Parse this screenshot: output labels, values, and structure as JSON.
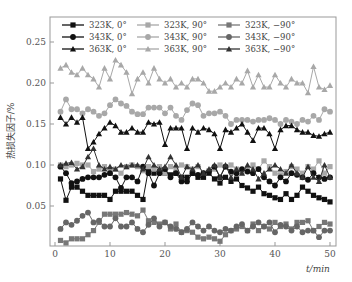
{
  "chart_data": {
    "type": "line",
    "title": "",
    "xlabel": "t/min",
    "ylabel": "热损失因子/%",
    "xlim": [
      -1,
      51
    ],
    "ylim": [
      0,
      0.275
    ],
    "xticks": [
      0,
      10,
      20,
      30,
      40,
      50
    ],
    "xtick_labels": [
      "0",
      "10",
      "20",
      "30",
      "40",
      "50"
    ],
    "yticks": [
      0.05,
      0.1,
      0.15,
      0.2,
      0.25
    ],
    "ytick_labels": [
      "0.05",
      "0.10",
      "0.15",
      "0.20",
      "0.25"
    ],
    "grid": false,
    "legend_position": "top, 3 columns inside plot",
    "x": [
      1,
      2,
      3,
      4,
      5,
      6,
      7,
      8,
      9,
      10,
      11,
      12,
      13,
      14,
      15,
      16,
      17,
      18,
      19,
      20,
      21,
      22,
      23,
      24,
      25,
      26,
      27,
      28,
      29,
      30,
      31,
      32,
      33,
      34,
      35,
      36,
      37,
      38,
      39,
      40,
      41,
      42,
      43,
      44,
      45,
      46,
      47,
      48,
      49,
      50
    ],
    "series": [
      {
        "name": "323K, 0°",
        "color": "#111111",
        "marker": "square",
        "values": [
          0.083,
          0.057,
          0.073,
          0.073,
          0.068,
          0.063,
          0.063,
          0.063,
          0.063,
          0.058,
          0.068,
          0.068,
          0.068,
          0.068,
          0.063,
          0.058,
          0.095,
          0.09,
          0.095,
          0.09,
          0.088,
          0.09,
          0.085,
          0.085,
          0.09,
          0.085,
          0.085,
          0.09,
          0.083,
          0.078,
          0.085,
          0.08,
          0.083,
          0.075,
          0.072,
          0.068,
          0.073,
          0.065,
          0.063,
          0.06,
          0.058,
          0.065,
          0.058,
          0.063,
          0.073,
          0.068,
          0.063,
          0.06,
          0.058,
          0.055
        ]
      },
      {
        "name": "323K, 90°",
        "color": "#a8a8a8",
        "marker": "square",
        "values": [
          0.1,
          0.098,
          0.1,
          0.102,
          0.1,
          0.1,
          0.092,
          0.095,
          0.098,
          0.092,
          0.095,
          0.09,
          0.098,
          0.1,
          0.098,
          0.093,
          0.098,
          0.095,
          0.098,
          0.09,
          0.098,
          0.095,
          0.1,
          0.098,
          0.095,
          0.098,
          0.09,
          0.093,
          0.095,
          0.1,
          0.098,
          0.1,
          0.095,
          0.092,
          0.095,
          0.1,
          0.095,
          0.105,
          0.098,
          0.09,
          0.088,
          0.092,
          0.098,
          0.095,
          0.09,
          0.098,
          0.095,
          0.105,
          0.09,
          0.098
        ]
      },
      {
        "name": "323K, −90°",
        "color": "#777777",
        "marker": "square",
        "values": [
          0.008,
          0.005,
          0.01,
          0.01,
          0.01,
          0.015,
          0.02,
          0.03,
          0.04,
          0.04,
          0.04,
          0.04,
          0.042,
          0.04,
          0.038,
          0.045,
          0.032,
          0.03,
          0.028,
          0.03,
          0.022,
          0.028,
          0.018,
          0.02,
          0.018,
          0.012,
          0.01,
          0.012,
          0.01,
          0.007,
          0.015,
          0.02,
          0.022,
          0.025,
          0.02,
          0.028,
          0.02,
          0.025,
          0.022,
          0.03,
          0.025,
          0.028,
          0.022,
          0.03,
          0.03,
          0.032,
          0.02,
          0.025,
          0.03,
          0.028
        ]
      },
      {
        "name": "343K, 0°",
        "color": "#111111",
        "marker": "circle",
        "values": [
          0.098,
          0.09,
          0.078,
          0.08,
          0.083,
          0.085,
          0.085,
          0.085,
          0.088,
          0.09,
          0.085,
          0.072,
          0.085,
          0.085,
          0.08,
          0.098,
          0.09,
          0.075,
          0.09,
          0.095,
          0.085,
          0.09,
          0.08,
          0.08,
          0.09,
          0.088,
          0.09,
          0.092,
          0.098,
          0.085,
          0.098,
          0.092,
          0.09,
          0.095,
          0.092,
          0.09,
          0.095,
          0.085,
          0.08,
          0.075,
          0.085,
          0.08,
          0.09,
          0.088,
          0.085,
          0.082,
          0.09,
          0.085,
          0.083,
          0.085
        ]
      },
      {
        "name": "343K, 90°",
        "color": "#a8a8a8",
        "marker": "circle",
        "values": [
          0.165,
          0.18,
          0.168,
          0.168,
          0.163,
          0.168,
          0.165,
          0.16,
          0.163,
          0.173,
          0.18,
          0.175,
          0.172,
          0.165,
          0.162,
          0.162,
          0.17,
          0.17,
          0.17,
          0.163,
          0.17,
          0.16,
          0.155,
          0.167,
          0.175,
          0.173,
          0.16,
          0.163,
          0.163,
          0.165,
          0.16,
          0.15,
          0.155,
          0.155,
          0.155,
          0.153,
          0.155,
          0.155,
          0.157,
          0.155,
          0.15,
          0.155,
          0.153,
          0.15,
          0.155,
          0.153,
          0.16,
          0.155,
          0.168,
          0.165
        ]
      },
      {
        "name": "343K, −90°",
        "color": "#666666",
        "marker": "circle",
        "values": [
          0.022,
          0.03,
          0.027,
          0.032,
          0.038,
          0.042,
          0.03,
          0.032,
          0.025,
          0.025,
          0.035,
          0.025,
          0.025,
          0.03,
          0.022,
          0.018,
          0.027,
          0.035,
          0.025,
          0.03,
          0.025,
          0.022,
          0.018,
          0.022,
          0.03,
          0.025,
          0.02,
          0.025,
          0.02,
          0.018,
          0.022,
          0.02,
          0.025,
          0.028,
          0.02,
          0.025,
          0.03,
          0.025,
          0.03,
          0.018,
          0.027,
          0.025,
          0.02,
          0.025,
          0.018,
          0.02,
          0.02,
          0.012,
          0.02,
          0.02
        ]
      },
      {
        "name": "363K, 0°",
        "color": "#111111",
        "marker": "triangle",
        "values": [
          0.158,
          0.15,
          0.158,
          0.152,
          0.158,
          0.12,
          0.128,
          0.138,
          0.145,
          0.152,
          0.148,
          0.14,
          0.14,
          0.145,
          0.14,
          0.14,
          0.152,
          0.15,
          0.152,
          0.125,
          0.145,
          0.145,
          0.145,
          0.12,
          0.145,
          0.14,
          0.145,
          0.143,
          0.138,
          0.12,
          0.143,
          0.14,
          0.145,
          0.15,
          0.14,
          0.13,
          0.145,
          0.145,
          0.138,
          0.12,
          0.143,
          0.148,
          0.148,
          0.143,
          0.14,
          0.14,
          0.136,
          0.135,
          0.138,
          0.14
        ]
      },
      {
        "name": "363K, 90°",
        "color": "#a8a8a8",
        "marker": "triangle",
        "values": [
          0.218,
          0.222,
          0.213,
          0.21,
          0.218,
          0.21,
          0.205,
          0.195,
          0.218,
          0.205,
          0.228,
          0.222,
          0.213,
          0.187,
          0.205,
          0.213,
          0.2,
          0.218,
          0.205,
          0.2,
          0.205,
          0.195,
          0.2,
          0.195,
          0.205,
          0.205,
          0.2,
          0.19,
          0.19,
          0.195,
          0.2,
          0.195,
          0.205,
          0.2,
          0.215,
          0.195,
          0.21,
          0.195,
          0.195,
          0.21,
          0.2,
          0.195,
          0.205,
          0.2,
          0.2,
          0.188,
          0.22,
          0.195,
          0.192,
          0.197
        ]
      },
      {
        "name": "363K, −90°",
        "color": "#333333",
        "marker": "triangle",
        "values": [
          0.1,
          0.102,
          0.103,
          0.095,
          0.098,
          0.11,
          0.12,
          0.1,
          0.095,
          0.098,
          0.095,
          0.1,
          0.098,
          0.1,
          0.1,
          0.095,
          0.11,
          0.1,
          0.095,
          0.098,
          0.11,
          0.1,
          0.085,
          0.098,
          0.095,
          0.1,
          0.09,
          0.095,
          0.1,
          0.085,
          0.1,
          0.085,
          0.095,
          0.09,
          0.1,
          0.095,
          0.083,
          0.09,
          0.095,
          0.1,
          0.095,
          0.09,
          0.1,
          0.09,
          0.085,
          0.098,
          0.085,
          0.08,
          0.1,
          0.085
        ]
      }
    ]
  },
  "axes": {
    "xlabel": "t/min",
    "ylabel": "热损失因子/%"
  },
  "legend": [
    {
      "label": "323K, 0°"
    },
    {
      "label": "323K, 90°"
    },
    {
      "label": "323K, −90°"
    },
    {
      "label": "343K, 0°"
    },
    {
      "label": "343K, 90°"
    },
    {
      "label": "343K, −90°"
    },
    {
      "label": "363K, 0°"
    },
    {
      "label": "363K, 90°"
    },
    {
      "label": "363K, −90°"
    }
  ]
}
